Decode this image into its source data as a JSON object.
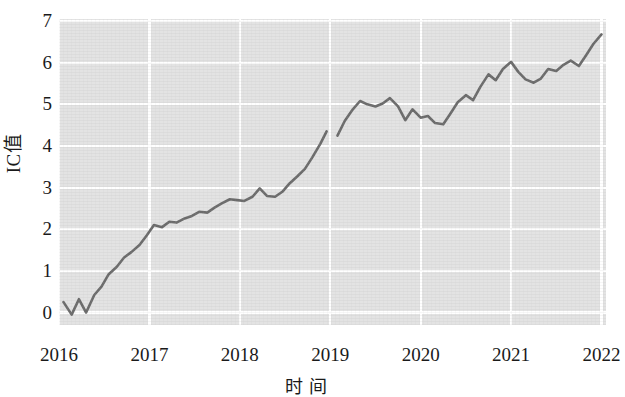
{
  "chart_data": {
    "type": "line",
    "title": "",
    "xlabel": "时  间",
    "ylabel": "IC值",
    "xlim": [
      2016.0,
      2022.05
    ],
    "ylim": [
      -0.3,
      7.05
    ],
    "yticks": [
      0,
      1,
      2,
      3,
      4,
      5,
      6,
      7
    ],
    "ytick_labels": [
      "0",
      "1",
      "2",
      "3",
      "4",
      "5",
      "6",
      "7"
    ],
    "xticks": [
      2016,
      2017,
      2018,
      2019,
      2020,
      2021,
      2022
    ],
    "xtick_labels": [
      "2016",
      "2017",
      "2018",
      "2019",
      "2020",
      "2021",
      "2022"
    ],
    "grid": true,
    "grid_color": "#ffffff",
    "panel_color": "#e3e3e3",
    "legend": null,
    "line_color": "#6b6b6b",
    "note": "Single series with a break (missing data) at the start of 2019",
    "series": [
      {
        "name": "IC值",
        "segments": [
          {
            "x": [
              2016.05,
              2016.14,
              2016.22,
              2016.3,
              2016.39,
              2016.47,
              2016.55,
              2016.64,
              2016.72,
              2016.8,
              2016.89,
              2016.97,
              2017.05,
              2017.14,
              2017.22,
              2017.3,
              2017.39,
              2017.47,
              2017.55,
              2017.64,
              2017.72,
              2017.8,
              2017.89,
              2017.97,
              2018.05,
              2018.14,
              2018.22,
              2018.3,
              2018.39,
              2018.47,
              2018.55,
              2018.64,
              2018.72,
              2018.8,
              2018.89,
              2018.96
            ],
            "y": [
              0.25,
              -0.05,
              0.32,
              0.0,
              0.42,
              0.62,
              0.92,
              1.1,
              1.32,
              1.45,
              1.62,
              1.85,
              2.1,
              2.05,
              2.18,
              2.16,
              2.26,
              2.32,
              2.42,
              2.4,
              2.52,
              2.62,
              2.72,
              2.7,
              2.68,
              2.78,
              2.98,
              2.8,
              2.78,
              2.9,
              3.1,
              3.28,
              3.45,
              3.72,
              4.05,
              4.35
            ]
          },
          {
            "x": [
              2019.08,
              2019.16,
              2019.25,
              2019.33,
              2019.41,
              2019.5,
              2019.58,
              2019.66,
              2019.75,
              2019.83,
              2019.91,
              2020.0,
              2020.08,
              2020.16,
              2020.25,
              2020.33,
              2020.41,
              2020.5,
              2020.58,
              2020.66,
              2020.75,
              2020.83,
              2020.91,
              2021.0,
              2021.08,
              2021.16,
              2021.25,
              2021.33,
              2021.41,
              2021.5,
              2021.58,
              2021.66,
              2021.75,
              2021.83,
              2021.91,
              2022.0
            ],
            "y": [
              4.25,
              4.6,
              4.88,
              5.08,
              5.0,
              4.95,
              5.02,
              5.15,
              4.95,
              4.62,
              4.88,
              4.68,
              4.72,
              4.55,
              4.52,
              4.78,
              5.05,
              5.22,
              5.1,
              5.42,
              5.72,
              5.58,
              5.85,
              6.02,
              5.78,
              5.6,
              5.52,
              5.62,
              5.85,
              5.8,
              5.95,
              6.05,
              5.92,
              6.18,
              6.45,
              6.68
            ]
          }
        ]
      }
    ]
  }
}
